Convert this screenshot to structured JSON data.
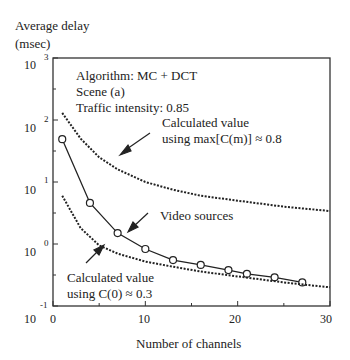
{
  "chart_data": {
    "type": "line",
    "title": "",
    "ylabel": "Average delay (msec)",
    "ylabel_line1": "Average delay",
    "ylabel_line2": "(msec)",
    "xlabel": "Number of channels",
    "xlim": [
      0,
      30
    ],
    "ylim": [
      0.1,
      1000
    ],
    "yscale": "log",
    "x_ticks": [
      "0",
      "10",
      "20",
      "30"
    ],
    "y_ticks": [
      {
        "base": "10",
        "exp": "3"
      },
      {
        "base": "10",
        "exp": "2"
      },
      {
        "base": "10",
        "exp": "1"
      },
      {
        "base": "10",
        "exp": "0"
      },
      {
        "base": "10",
        "exp": "-1"
      }
    ],
    "annotations": {
      "algorithm": "Algorithm:  MC + DCT",
      "scene": "Scene (a)",
      "traffic": "Traffic intensity:  0.85",
      "upper_label_1": "Calculated value",
      "upper_label_2": "using max[C(m)] ≈ 0.8",
      "video_label": "Video sources",
      "lower_label_1": "Calculated value",
      "lower_label_2": "using C(0) ≈ 0.3"
    },
    "series": [
      {
        "name": "Video sources",
        "style": "solid-with-circles",
        "x": [
          1,
          4,
          7,
          10,
          13,
          16,
          19,
          21,
          24,
          27
        ],
        "y": [
          49,
          4.6,
          1.5,
          0.83,
          0.55,
          0.46,
          0.38,
          0.33,
          0.29,
          0.24
        ]
      },
      {
        "name": "Calculated value using max[C(m)] = 0.8",
        "style": "dash-dot",
        "x": [
          1,
          3,
          5,
          7,
          10,
          13,
          16,
          20,
          25,
          30
        ],
        "y": [
          130,
          50,
          25,
          16,
          10,
          7.5,
          6,
          5,
          4,
          3.4
        ]
      },
      {
        "name": "Calculated value using C(0) = 0.3",
        "style": "dash-dot",
        "x": [
          1,
          3,
          5,
          7,
          10,
          13,
          16,
          20,
          25,
          30
        ],
        "y": [
          6,
          1.8,
          0.95,
          0.7,
          0.52,
          0.43,
          0.36,
          0.3,
          0.24,
          0.2
        ]
      }
    ]
  }
}
